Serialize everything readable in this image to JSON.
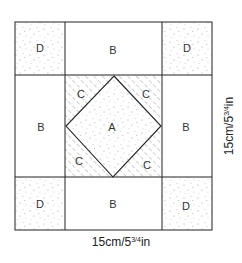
{
  "diagram": {
    "colors": {
      "line": "#222222",
      "speckle": "#9a9a9a",
      "hatch": "#8a8a8a",
      "background": "#ffffff"
    },
    "pieces": {
      "center": {
        "label": "A",
        "fill": "speckled"
      },
      "sides": [
        {
          "position": "top",
          "label": "B"
        },
        {
          "position": "left",
          "label": "B"
        },
        {
          "position": "right",
          "label": "B"
        },
        {
          "position": "bottom",
          "label": "B"
        }
      ],
      "triangles": [
        {
          "position": "top-left",
          "label": "C"
        },
        {
          "position": "top-right",
          "label": "C"
        },
        {
          "position": "bottom-left",
          "label": "C"
        },
        {
          "position": "bottom-right",
          "label": "C"
        }
      ],
      "corners": [
        {
          "position": "top-left",
          "label": "D"
        },
        {
          "position": "top-right",
          "label": "D"
        },
        {
          "position": "bottom-left",
          "label": "D"
        },
        {
          "position": "bottom-right",
          "label": "D"
        }
      ]
    },
    "dimensions": {
      "width_label": "15cm/5¾in",
      "height_label": "15cm/5¾in",
      "width_main": "15cm/5",
      "width_fraction": "3/4",
      "width_unit": "in",
      "height_main": "15cm/5",
      "height_fraction": "3/4",
      "height_unit": "in"
    }
  }
}
